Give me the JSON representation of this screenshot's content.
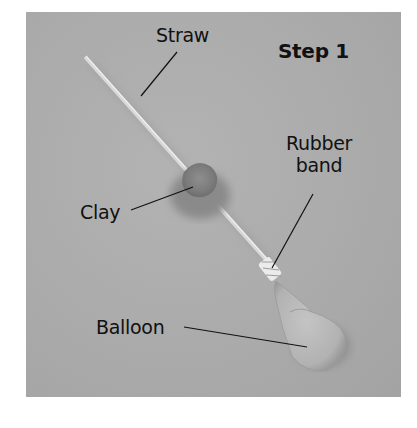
{
  "figure": {
    "title": "Step 1",
    "labels": {
      "straw": "Straw",
      "clay": "Clay",
      "rubber_band_line1": "Rubber",
      "rubber_band_line2": "band",
      "balloon": "Balloon"
    },
    "colors": {
      "background": "#aaaaaa",
      "text": "#111111",
      "leader_line": "#111111"
    }
  }
}
